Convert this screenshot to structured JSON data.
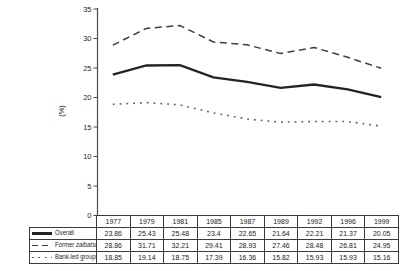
{
  "figure": {
    "background": "#ffffff",
    "text_color": "#1f1f1f",
    "axis_color": "#4a4a4a",
    "table_border_color": "#3c3c3c"
  },
  "chart_data": {
    "type": "line",
    "title": "",
    "xlabel": "",
    "ylabel": "(%)",
    "ylim": [
      0,
      35
    ],
    "yticks": [
      0,
      5,
      10,
      15,
      20,
      25,
      30,
      35
    ],
    "grid": false,
    "legend_position": "table-left-column",
    "categories": [
      "1977",
      "1979",
      "1981",
      "1985",
      "1987",
      "1989",
      "1992",
      "1996",
      "1999"
    ],
    "series": [
      {
        "name": "Overall",
        "name_runs": [
          {
            "text": "Overall",
            "italic": false
          }
        ],
        "line_style": "solid",
        "color": "#232323",
        "values": [
          23.86,
          25.43,
          25.48,
          23.4,
          22.65,
          21.64,
          22.21,
          21.37,
          20.05
        ]
      },
      {
        "name": "Former zaibatsu",
        "name_runs": [
          {
            "text": "Former ",
            "italic": false
          },
          {
            "text": "zaibatsu",
            "italic": true
          }
        ],
        "line_style": "dashed",
        "color": "#3f3f3f",
        "values": [
          28.86,
          31.71,
          32.21,
          29.41,
          28.93,
          27.46,
          28.48,
          26.81,
          24.95
        ]
      },
      {
        "name": "Bank-led groups",
        "name_runs": [
          {
            "text": "Bank-led groups",
            "italic": false
          }
        ],
        "line_style": "dotted",
        "color": "#606060",
        "values": [
          18.85,
          19.14,
          18.75,
          17.39,
          16.36,
          15.82,
          15.93,
          15.93,
          15.16
        ]
      }
    ]
  }
}
